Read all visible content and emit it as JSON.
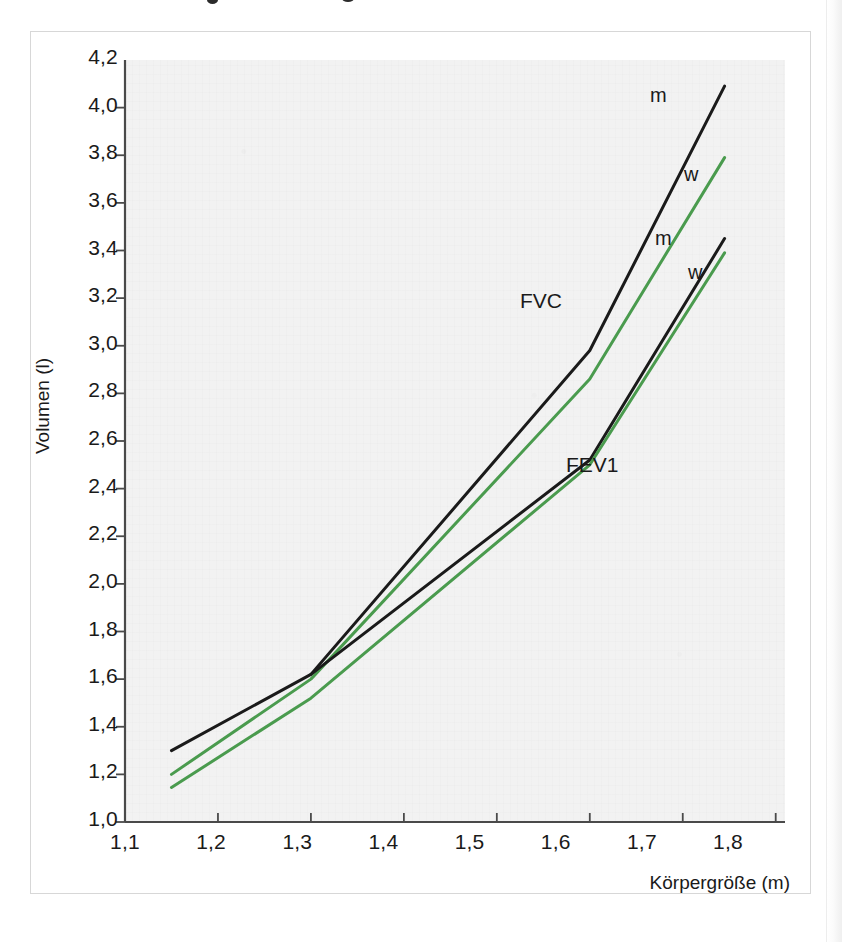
{
  "figure": {
    "background_color": "#f2f2f2",
    "frame_color": "#d7d7d7"
  },
  "axes": {
    "y_title": "Volumen (l)",
    "x_title": "Körpergröße (m)",
    "y_ticks": [
      "1,0",
      "1,2",
      "1,4",
      "1,6",
      "1,8",
      "2,0",
      "2,2",
      "2,4",
      "2,6",
      "2,8",
      "3,0",
      "3,2",
      "3,4",
      "3,6",
      "3,8",
      "4,0",
      "4,2"
    ],
    "x_ticks": [
      "1,1",
      "1,2",
      "1,3",
      "1,4",
      "1,5",
      "1,6",
      "1,7",
      "1,8"
    ]
  },
  "annotations": {
    "fvc_group": "FVC",
    "fev1_group": "FEV1",
    "fvc_male": "m",
    "fvc_female": "w",
    "fev1_male": "m",
    "fev1_female": "w"
  },
  "colors": {
    "male_line": "#1a1a1a",
    "female_line": "#4a9b4e",
    "axis": "#4a4a4a",
    "text": "#1a1a1a"
  },
  "chart_data": {
    "type": "line",
    "title": "",
    "xlabel": "Körpergröße (m)",
    "ylabel": "Volumen (l)",
    "xlim": [
      1.1,
      1.81
    ],
    "ylim": [
      1.0,
      4.2
    ],
    "xtick_values": [
      1.1,
      1.2,
      1.3,
      1.4,
      1.5,
      1.6,
      1.7,
      1.8
    ],
    "ytick_values": [
      1.0,
      1.2,
      1.4,
      1.6,
      1.8,
      2.0,
      2.2,
      2.4,
      2.6,
      2.8,
      3.0,
      3.2,
      3.4,
      3.6,
      3.8,
      4.0,
      4.2
    ],
    "grid": false,
    "legend": "inline-end-labels",
    "series": [
      {
        "name": "FVC m",
        "group": "FVC",
        "sex": "m",
        "color": "#1a1a1a",
        "x": [
          1.15,
          1.3,
          1.6,
          1.745
        ],
        "y": [
          1.3,
          1.62,
          2.98,
          4.09
        ]
      },
      {
        "name": "FVC w",
        "group": "FVC",
        "sex": "w",
        "color": "#4a9b4e",
        "x": [
          1.15,
          1.3,
          1.6,
          1.745
        ],
        "y": [
          1.2,
          1.6,
          2.86,
          3.79
        ]
      },
      {
        "name": "FEV1 m",
        "group": "FEV1",
        "sex": "m",
        "color": "#1a1a1a",
        "x": [
          1.3,
          1.6,
          1.745
        ],
        "y": [
          1.62,
          2.52,
          3.45
        ]
      },
      {
        "name": "FEV1 w",
        "group": "FEV1",
        "sex": "w",
        "color": "#4a9b4e",
        "x": [
          1.15,
          1.3,
          1.6,
          1.745
        ],
        "y": [
          1.145,
          1.52,
          2.5,
          3.39
        ]
      }
    ]
  }
}
